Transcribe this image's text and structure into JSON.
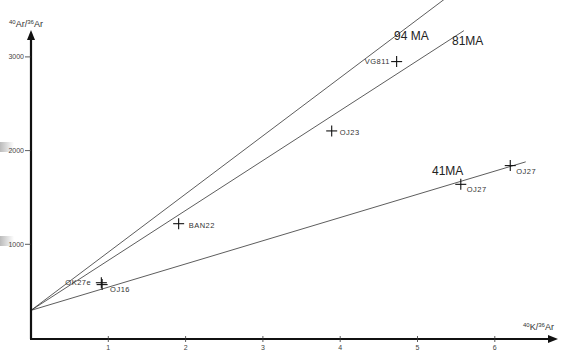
{
  "chart_data": {
    "type": "line",
    "title": "",
    "xlabel": "40K/36Ar",
    "ylabel": "40Ar/36Ar",
    "xlabel_parts": {
      "sup1": "40",
      "base1": "K",
      "sep": "/",
      "sup2": "36",
      "base2": "Ar"
    },
    "ylabel_parts": {
      "sup1": "40",
      "base1": "Ar",
      "sep": "/",
      "sup2": "36",
      "base2": "Ar"
    },
    "xlim": [
      0,
      6.5
    ],
    "ylim": [
      0,
      3600
    ],
    "x_ticks": [
      1,
      2,
      3,
      4,
      5,
      6
    ],
    "x_tick_labels": [
      "1",
      "2",
      "3",
      "4",
      "5",
      "6"
    ],
    "y_ticks": [
      1000,
      2000,
      3000
    ],
    "y_tick_labels": [
      "1000",
      "2000",
      "3000"
    ],
    "grid": false,
    "legend": "none",
    "intercept": 295,
    "series": [
      {
        "name": "94MA",
        "label": "94 MA",
        "type": "isochron",
        "x": [
          0,
          5.5
        ],
        "y": [
          295,
          3710
        ]
      },
      {
        "name": "81MA",
        "label": "81MA",
        "type": "isochron",
        "x": [
          0,
          5.6
        ],
        "y": [
          295,
          3280
        ]
      },
      {
        "name": "41MA",
        "label": "41MA",
        "type": "isochron",
        "x": [
          0,
          6.4
        ],
        "y": [
          295,
          1880
        ]
      },
      {
        "name": "samples",
        "type": "scatter",
        "points": [
          {
            "label": "OK27e",
            "x": 0.91,
            "y": 590
          },
          {
            "label": "OJ16",
            "x": 0.92,
            "y": 570
          },
          {
            "label": "BAN22",
            "x": 1.91,
            "y": 1220
          },
          {
            "label": "OJ23",
            "x": 3.89,
            "y": 2210
          },
          {
            "label": "VG811",
            "x": 4.73,
            "y": 2950
          },
          {
            "label": "OJ27",
            "x": 5.56,
            "y": 1640
          },
          {
            "label": "OJ27",
            "x": 6.2,
            "y": 1840
          }
        ]
      }
    ]
  }
}
